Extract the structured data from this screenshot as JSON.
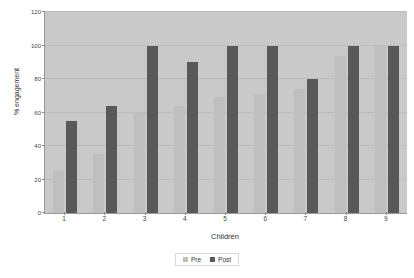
{
  "chart_data": {
    "type": "bar",
    "title": "",
    "xlabel": "Children",
    "ylabel": "% engagement",
    "categories": [
      "1",
      "2",
      "3",
      "4",
      "5",
      "6",
      "7",
      "8",
      "9"
    ],
    "series": [
      {
        "name": "Pre",
        "color": "#bfbfbf",
        "values": [
          25,
          35,
          60,
          64,
          69,
          71,
          74,
          94,
          100
        ]
      },
      {
        "name": "Post",
        "color": "#595959",
        "values": [
          55,
          64,
          100,
          90,
          100,
          100,
          80,
          100,
          100
        ]
      }
    ],
    "ylim": [
      0,
      120
    ],
    "yticks": [
      0,
      20,
      40,
      60,
      80,
      100,
      120
    ],
    "ytick_labels": [
      "0",
      "20",
      "40",
      "60",
      "80",
      "100",
      "120"
    ],
    "grid": true,
    "legend_position": "bottom",
    "plot_background": "#c9c9c9"
  }
}
